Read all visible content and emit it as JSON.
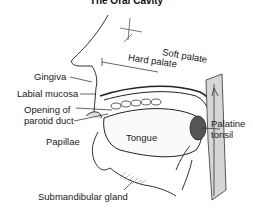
{
  "title": "The Oral Cavity",
  "labels": {
    "gingiva": "Gingiva",
    "labial_mucosa": "Labial mucosa",
    "opening_parotid_line1": "Opening of",
    "opening_parotid_line2": "parotid duct",
    "papillae": "Papillae",
    "tongue": "Tongue",
    "hard_palate": "Hard palate",
    "soft_palate": "Soft palate",
    "palatine_tonsil_line1": "Palatine",
    "palatine_tonsil_line2": "tonsil",
    "submandibular_gland": "Submandibular gland"
  }
}
